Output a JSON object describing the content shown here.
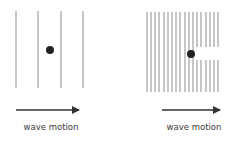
{
  "diagram": {
    "title": "",
    "colors": {
      "wavefront": "#a8a8a8",
      "dot": "#222222",
      "arrow": "#333333",
      "text": "#3a3a3a"
    },
    "panels": [
      {
        "id": "long-wavelength",
        "wavefront_x": [
          16,
          38,
          61,
          83
        ],
        "wavefront_y": [
          11,
          88
        ],
        "dot": {
          "x": 50,
          "y": 50,
          "r": 4
        },
        "gap": null,
        "arrow": {
          "x1": 16,
          "x2": 85,
          "y": 110
        },
        "label": "wave motion",
        "label_x": 51,
        "label_y": 130
      },
      {
        "id": "short-wavelength",
        "wavefront_x": [
          147,
          151,
          155,
          159,
          164,
          168,
          172,
          176,
          180,
          185,
          189,
          193,
          197,
          201,
          206,
          210,
          214,
          218
        ],
        "wavefront_y": [
          12,
          92
        ],
        "dot": {
          "x": 191,
          "y": 54,
          "r": 4
        },
        "gap": {
          "from_x": 195,
          "y1": 47,
          "y2": 60
        },
        "arrow": {
          "x1": 162,
          "x2": 226,
          "y": 110
        },
        "label": "wave motion",
        "label_x": 194,
        "label_y": 130
      }
    ]
  }
}
